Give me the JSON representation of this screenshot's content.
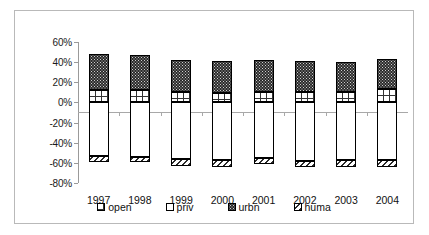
{
  "chart_data": {
    "type": "bar",
    "stacked": true,
    "title": "",
    "xlabel": "",
    "ylabel": "",
    "categories": [
      "1997",
      "1998",
      "1999",
      "2000",
      "2001",
      "2002",
      "2003",
      "2004"
    ],
    "ylim": [
      -80,
      60
    ],
    "ytick_labels": [
      "60%",
      "40%",
      "20%",
      "0%",
      "-20%",
      "-40%",
      "-60%",
      "-80%"
    ],
    "ytick_values": [
      60,
      40,
      20,
      0,
      -20,
      -40,
      -60,
      -80
    ],
    "grid": false,
    "legend_position": "bottom",
    "series": [
      {
        "name": "open",
        "values": [
          12,
          12,
          10,
          9,
          10,
          10,
          10,
          13
        ]
      },
      {
        "name": "priv",
        "values": [
          -53,
          -54,
          -56,
          -57,
          -55,
          -58,
          -57,
          -57
        ]
      },
      {
        "name": "urbn",
        "values": [
          36,
          35,
          32,
          32,
          32,
          31,
          30,
          30
        ]
      },
      {
        "name": "huma",
        "values": [
          -6,
          -5,
          -7,
          -7,
          -6,
          -6,
          -7,
          -7
        ]
      }
    ]
  },
  "axis": {
    "ticks": [
      {
        "label": "60%",
        "value": 60
      },
      {
        "label": "40%",
        "value": 40
      },
      {
        "label": "20%",
        "value": 20
      },
      {
        "label": "0%",
        "value": 0
      },
      {
        "label": "-20%",
        "value": -20
      },
      {
        "label": "-40%",
        "value": -40
      },
      {
        "label": "-60%",
        "value": -60
      },
      {
        "label": "-80%",
        "value": -80
      }
    ]
  },
  "legend": {
    "items": [
      {
        "label": "open",
        "pattern": "grid"
      },
      {
        "label": "priv",
        "pattern": "solid-white"
      },
      {
        "label": "urbn",
        "pattern": "dark-dotted"
      },
      {
        "label": "huma",
        "pattern": "diagonal-hatch"
      }
    ]
  },
  "colors": {
    "frame": "#b9b9b9",
    "axis": "#9a9a9a",
    "bar_outline": "#000000",
    "urbn_fill": "#2b2b2b",
    "priv_fill": "#ffffff",
    "background": "#ffffff"
  }
}
